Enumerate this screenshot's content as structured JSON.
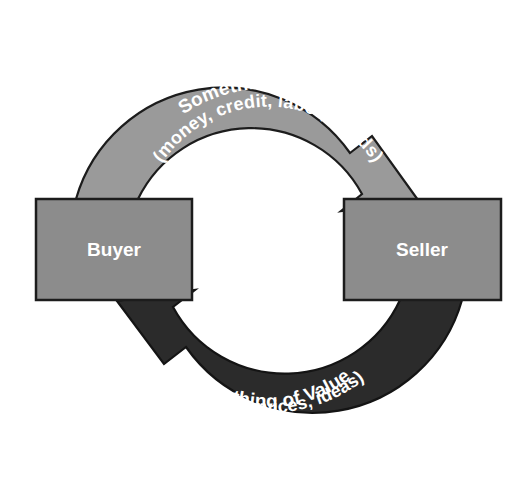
{
  "diagram": {
    "colors": {
      "background": "#ffffff",
      "arrow_light": "#9a9a9a",
      "arrow_dark": "#2b2b2b",
      "box_fill": "#8c8c8c",
      "box_stroke": "#1c1c1c",
      "label_text": "#ffffff"
    },
    "nodes": [
      {
        "id": "buyer",
        "label": "Buyer",
        "x": 36,
        "y": 199,
        "width": 156,
        "height": 101
      },
      {
        "id": "seller",
        "label": "Seller",
        "x": 344,
        "y": 199,
        "width": 157,
        "height": 101
      }
    ],
    "flows": [
      {
        "id": "buyer-to-seller",
        "from": "Buyer",
        "to": "Seller",
        "direction": "clockwise",
        "style": "light",
        "line1": "Something of Value",
        "line2": "(money, credit, labor, goods)"
      },
      {
        "id": "seller-to-buyer",
        "from": "Seller",
        "to": "Buyer",
        "direction": "counter-clockwise",
        "style": "dark",
        "line1": "Something of Value",
        "line2": "(goods, services, ideas)"
      }
    ]
  }
}
